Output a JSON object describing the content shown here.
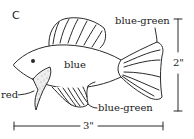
{
  "panel_label": "C",
  "labels": {
    "body": "blue",
    "pectoral_fin": "red",
    "tail_fin": "blue-green",
    "anal_fin": "blue-green"
  },
  "dimensions": {
    "height": "2\"",
    "width": "3\""
  },
  "colors": {
    "line": "#2a2a2a",
    "background": "#ffffff"
  }
}
